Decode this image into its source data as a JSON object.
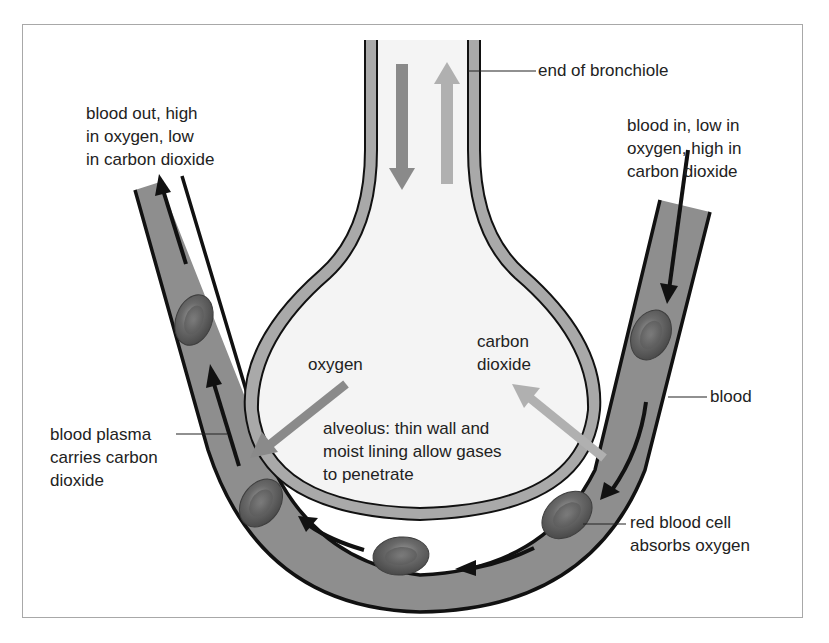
{
  "diagram": {
    "labels": {
      "bronchiole": "end of bronchiole",
      "blood_out": [
        "blood out, high",
        "in oxygen, low",
        "in carbon dioxide"
      ],
      "blood_in": [
        "blood in, low in",
        "oxygen, high in",
        "carbon dioxide"
      ],
      "oxygen": "oxygen",
      "carbon_dioxide": [
        "carbon",
        "dioxide"
      ],
      "alveolus": [
        "alveolus: thin wall and",
        "moist lining allow gases",
        "to penetrate"
      ],
      "blood": "blood",
      "plasma": [
        "blood plasma",
        "carries carbon",
        "dioxide"
      ],
      "rbc": [
        "red blood cell",
        "absorbs oxygen"
      ]
    },
    "colors": {
      "capillary_fill": "#8e8e8e",
      "alveolus_wall": "#a9a9a9",
      "alveolus_interior": "#f4f4f4",
      "outline": "#111111",
      "oxygen_arrow": "#8a8a8a",
      "co2_arrow": "#b0b0b0",
      "red_blood_cell": "#6e6e6e",
      "frame_border": "#a8a8a8"
    }
  }
}
